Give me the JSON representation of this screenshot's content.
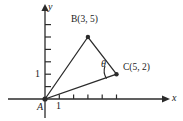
{
  "figure": {
    "type": "coordinate-geometry-diagram",
    "stroke_color": "#2b2b2b",
    "background_color": "#ffffff",
    "axes": {
      "x_label": "x",
      "y_label": "y",
      "x_tick_label": "1",
      "y_tick_label": "1",
      "x_ticks": [
        1,
        2,
        3,
        4,
        5
      ],
      "y_ticks": [
        1,
        2,
        3,
        4,
        5,
        6
      ],
      "origin_label": "A"
    },
    "points": [
      {
        "name": "A",
        "label": "A",
        "x": 0,
        "y": 0
      },
      {
        "name": "B",
        "label": "B(3, 5)",
        "x": 3,
        "y": 5
      },
      {
        "name": "C",
        "label": "C(5, 2)",
        "x": 5,
        "y": 2
      }
    ],
    "angle": {
      "symbol": "θ",
      "at_vertex": "C"
    },
    "triangle_vertices": [
      "A",
      "B",
      "C"
    ]
  }
}
